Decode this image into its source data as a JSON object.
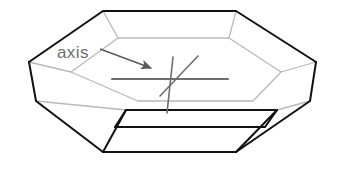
{
  "figure": {
    "background_color": "#ffffff",
    "width": 348,
    "height": 173,
    "annotation": {
      "label": "axis",
      "label_x": 57,
      "label_y": 58,
      "label_color": "#6e6e6e",
      "leader_color": "#5a5a5a",
      "leader_start_x": 100,
      "leader_start_y": 49,
      "leader_end_x": 151,
      "leader_end_y": 68,
      "arrowhead": "arrow-right"
    },
    "colors": {
      "outline_dark": "#111111",
      "outline_light": "#b9b9b9",
      "axis_gray": "#6e6e6e",
      "axis_mid_gray": "#8a8a8a"
    },
    "stroke_widths": {
      "outline_dark": 2.0,
      "outline_light": 1.3,
      "axis": 1.6,
      "axis_horizontal": 2.2
    },
    "shape": {
      "name": "hexagonal-plate-crystal",
      "top_face_outer": [
        [
          103,
          11
        ],
        [
          236,
          11
        ],
        [
          316,
          62
        ],
        [
          277,
          110
        ],
        [
          126,
          110
        ],
        [
          29,
          62
        ]
      ],
      "top_face_inner": [
        [
          118,
          38
        ],
        [
          229,
          38
        ],
        [
          281,
          72
        ],
        [
          253,
          101
        ],
        [
          138,
          101
        ],
        [
          71,
          72
        ]
      ],
      "bottom_face": [
        [
          103,
          152
        ],
        [
          236,
          152
        ],
        [
          283,
          116
        ],
        [
          277,
          110
        ],
        [
          126,
          110
        ],
        [
          86,
          116
        ]
      ],
      "bottom_outline": [
        [
          29,
          62
        ],
        [
          36,
          101
        ],
        [
          103,
          152
        ],
        [
          236,
          152
        ],
        [
          310,
          101
        ],
        [
          316,
          62
        ]
      ],
      "vertical_edges": [
        [
          [
            29,
            62
          ],
          [
            36,
            101
          ]
        ],
        [
          [
            126,
            110
          ],
          [
            103,
            152
          ]
        ],
        [
          [
            277,
            110
          ],
          [
            310,
            101
          ]
        ],
        [
          [
            316,
            62
          ],
          [
            310,
            101
          ]
        ]
      ]
    },
    "axes_marks": {
      "center_x": 180,
      "center_y": 79,
      "lines": [
        {
          "name": "c-axis-vertical",
          "x1": 173,
          "y1": 57,
          "x2": 167,
          "y2": 113,
          "color": "#6e6e6e",
          "width": 1.6
        },
        {
          "name": "a-axis-diagonal",
          "x1": 198,
          "y1": 56,
          "x2": 160,
          "y2": 96,
          "color": "#6e6e6e",
          "width": 1.6
        },
        {
          "name": "a-axis-horizontal",
          "x1": 112,
          "y1": 79,
          "x2": 228,
          "y2": 79,
          "color": "#6e6e6e",
          "width": 2.2
        }
      ]
    }
  }
}
